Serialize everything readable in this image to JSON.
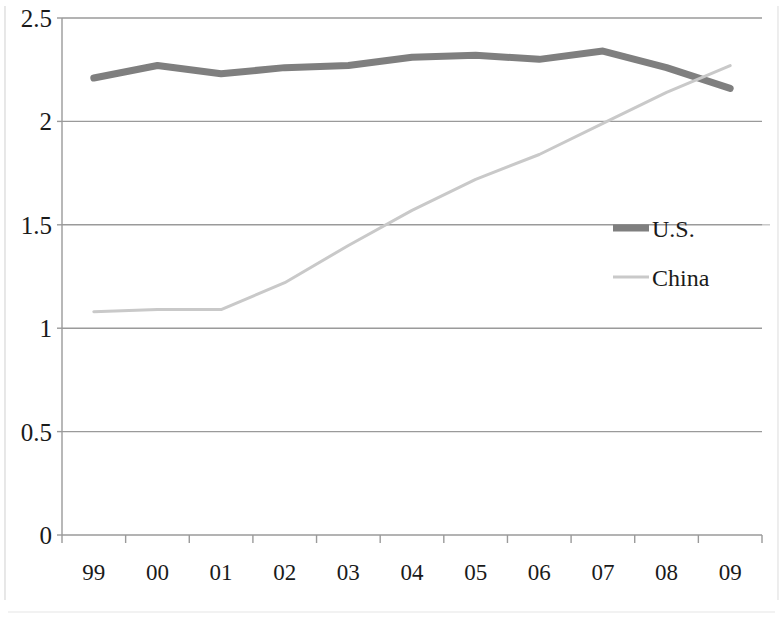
{
  "chart_data": {
    "type": "line",
    "title": "",
    "subtitle": "",
    "xlabel": "",
    "ylabel": "",
    "categories": [
      "99",
      "00",
      "01",
      "02",
      "03",
      "04",
      "05",
      "06",
      "07",
      "08",
      "09"
    ],
    "series": [
      {
        "name": "U.S.",
        "color": "#7f7f7f",
        "line_width": 7,
        "values": [
          2.21,
          2.27,
          2.23,
          2.26,
          2.27,
          2.31,
          2.32,
          2.3,
          2.34,
          2.26,
          2.16
        ]
      },
      {
        "name": "China",
        "color": "#c9c9c9",
        "line_width": 3,
        "values": [
          1.08,
          1.09,
          1.09,
          1.22,
          1.4,
          1.57,
          1.72,
          1.84,
          1.99,
          2.14,
          2.27
        ]
      }
    ],
    "ylim": [
      0,
      2.5
    ],
    "yticks": [
      0,
      0.5,
      1,
      1.5,
      2,
      2.5
    ],
    "ytick_labels": [
      "0",
      "0.5",
      "1",
      "1.5",
      "2",
      "2.5"
    ],
    "grid": true,
    "grid_color": "#9a9a9a",
    "axis_color": "#9a9a9a",
    "legend_position": "right-middle",
    "background": "#ffffff"
  },
  "axis": {
    "y_labels": [
      "2.5",
      "2",
      "1.5",
      "1",
      "0.5",
      "0"
    ],
    "x_labels": [
      "99",
      "00",
      "01",
      "02",
      "03",
      "04",
      "05",
      "06",
      "07",
      "08",
      "09"
    ]
  },
  "legend": {
    "entries": [
      {
        "label": "U.S.",
        "color": "#7f7f7f",
        "width": 7
      },
      {
        "label": "China",
        "color": "#c9c9c9",
        "width": 3
      }
    ]
  }
}
